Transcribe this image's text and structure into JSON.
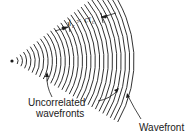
{
  "diagram": {
    "coherence_label": "l",
    "coherence_sub": "c",
    "coherence_eq": " = cτ",
    "coherence_eq_sub": "c",
    "label_uncorrelated_line1": "Uncorrelated",
    "label_uncorrelated_line2": "wavefronts",
    "label_wavefront": "Wavefront",
    "source": {
      "x": 12,
      "y": 61
    },
    "arc_count": 28,
    "ink_color": "#1a1a1a"
  }
}
